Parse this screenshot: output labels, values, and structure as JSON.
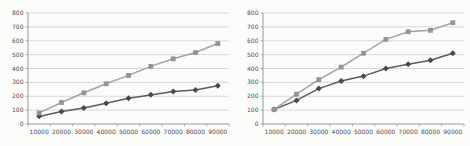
{
  "page": {
    "background": "#fcfcfb"
  },
  "colors": {
    "gridline": "#c8c8c8",
    "axis": "#909090",
    "tick_label": "#4d4d4d"
  },
  "chart_data": [
    {
      "type": "line",
      "title": "",
      "xlabel": "",
      "ylabel": "",
      "legend": "none",
      "grid": true,
      "ylim": [
        0,
        800
      ],
      "ytick_step": 100,
      "ytick_labels": [
        "0",
        "100",
        "200",
        "300",
        "400",
        "500",
        "600",
        "700",
        "800"
      ],
      "x_categories": [
        "10000",
        "20000",
        "30000",
        "40000",
        "50000",
        "60000",
        "70000",
        "80000",
        "90000"
      ],
      "series": [
        {
          "name": "dark-diamond-series",
          "marker": "diamond",
          "line_color": "#5d5a5a",
          "marker_color": "#4a4848",
          "values": [
            55,
            90,
            115,
            150,
            185,
            210,
            235,
            245,
            275
          ]
        },
        {
          "name": "light-square-series",
          "marker": "square",
          "line_color": "#a6a2a2",
          "marker_color": "#979393",
          "values": [
            80,
            155,
            225,
            290,
            350,
            415,
            470,
            515,
            580
          ]
        }
      ]
    },
    {
      "type": "line",
      "title": "",
      "xlabel": "",
      "ylabel": "",
      "legend": "none",
      "grid": true,
      "ylim": [
        0,
        800
      ],
      "ytick_step": 100,
      "ytick_labels": [
        "0",
        "100",
        "200",
        "300",
        "400",
        "500",
        "600",
        "700",
        "800"
      ],
      "x_categories": [
        "10000",
        "20000",
        "30000",
        "40000",
        "50000",
        "60000",
        "70000",
        "80000",
        "90000"
      ],
      "series": [
        {
          "name": "dark-diamond-series",
          "marker": "diamond",
          "line_color": "#5d5a5a",
          "marker_color": "#4a4848",
          "values": [
            105,
            170,
            255,
            310,
            345,
            400,
            430,
            460,
            510
          ]
        },
        {
          "name": "light-square-series",
          "marker": "square",
          "line_color": "#a6a2a2",
          "marker_color": "#979393",
          "values": [
            105,
            215,
            320,
            410,
            510,
            610,
            665,
            675,
            730
          ]
        }
      ]
    }
  ]
}
